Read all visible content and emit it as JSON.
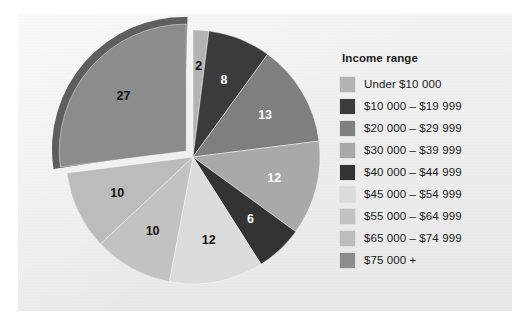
{
  "figure": {
    "background_color": "#eeeeee",
    "page_color": "#ffffff"
  },
  "legend": {
    "title": "Income range",
    "items": [
      {
        "label": "Under $10 000",
        "color": "#b3b3b3"
      },
      {
        "label": "$10 000 – $19 999",
        "color": "#3b3b3b"
      },
      {
        "label": "$20 000 – $29 999",
        "color": "#7f7f7f"
      },
      {
        "label": "$30 000 – $39 999",
        "color": "#a9a9a9"
      },
      {
        "label": "$40 000 – $44 999",
        "color": "#333333"
      },
      {
        "label": "$45 000 – $54 999",
        "color": "#dcdcdc"
      },
      {
        "label": "$55 000 – $64 999",
        "color": "#c2c2c2"
      },
      {
        "label": "$65 000 – $74 999",
        "color": "#bcbcbc"
      },
      {
        "label": "$75 000 +",
        "color": "#8c8c8c"
      }
    ]
  },
  "chart_data": {
    "type": "pie",
    "title": "",
    "legend_title": "Income range",
    "legend_position": "right",
    "total": 100,
    "units": "percent",
    "start_angle_deg": 0,
    "direction": "clockwise",
    "exploded_slice": "$75 000 +",
    "categories": [
      "Under $10 000",
      "$10 000 – $19 999",
      "$20 000 – $29 999",
      "$30 000 – $39 999",
      "$40 000 – $44 999",
      "$45 000 – $54 999",
      "$55 000 – $64 999",
      "$65 000 – $74 999",
      "$75 000 +"
    ],
    "values": [
      2,
      8,
      13,
      12,
      6,
      12,
      10,
      10,
      27
    ],
    "colors": [
      "#b3b3b3",
      "#3b3b3b",
      "#7f7f7f",
      "#a9a9a9",
      "#333333",
      "#dcdcdc",
      "#c2c2c2",
      "#bcbcbc",
      "#8c8c8c"
    ],
    "data_labels": [
      "2",
      "8",
      "13",
      "12",
      "6",
      "12",
      "10",
      "10",
      "27"
    ],
    "data_label_text_colors": [
      "dark",
      "light",
      "light",
      "light",
      "light",
      "dark",
      "dark",
      "dark",
      "dark"
    ]
  }
}
